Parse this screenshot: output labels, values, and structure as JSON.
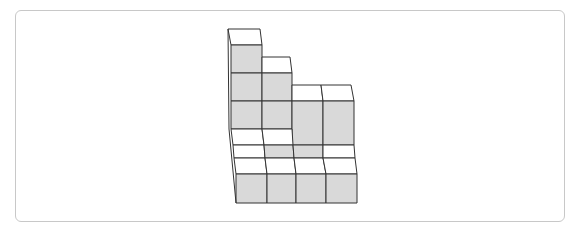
{
  "figure": {
    "colors": {
      "front_face": "#d9d9d9",
      "top_face": "#ffffff",
      "edge": "#333333",
      "frame_border": "#c8c8c8"
    },
    "column_heights": [
      6,
      5,
      4,
      4
    ],
    "front_row_heights": [
      1,
      1,
      1,
      1
    ]
  }
}
